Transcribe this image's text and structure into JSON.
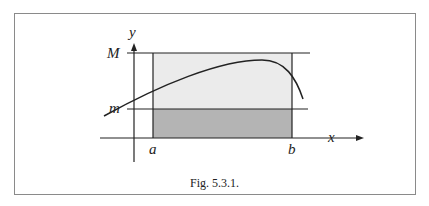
{
  "figure": {
    "caption": "Fig. 5.3.1.",
    "labels": {
      "y_axis": "y",
      "x_axis": "x",
      "upper_bound": "M",
      "lower_bound": "m",
      "left_endpoint": "a",
      "right_endpoint": "b"
    },
    "colors": {
      "upper_rect_fill": "#ebebeb",
      "lower_rect_fill": "#b4b4b4",
      "line": "#222222",
      "frame": "#8a8a8a"
    }
  }
}
